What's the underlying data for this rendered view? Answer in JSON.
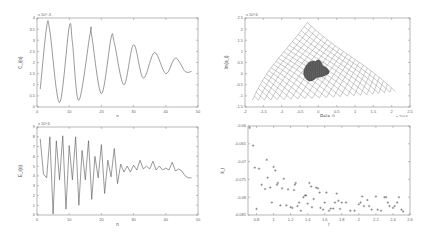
{
  "chart_data": [
    {
      "id": "top-left",
      "type": "line",
      "title": "",
      "xlabel": "n",
      "ylabel": "C_i(n)",
      "y_multiplier": "x 10^-3",
      "xlim": [
        0,
        50
      ],
      "ylim": [
        0,
        4
      ],
      "xticks": [
        0,
        10,
        20,
        30,
        40,
        50
      ],
      "yticks": [
        0,
        0.5,
        1,
        1.5,
        2,
        2.5,
        3,
        3.5,
        4
      ],
      "grid": false,
      "description": "Damped oscillation: peaks ~3.6, 3.6, 3.3, 3.1, 2.8, 2.5, 2.2; troughs ~0.2, 0.3, 0.6, 1.0, 1.3, 1.5, decaying toward ~1.6 at n=48",
      "series": [
        {
          "name": "C_i(n)",
          "x": [
            1,
            3,
            4,
            7,
            10,
            11,
            13,
            16.5,
            17,
            20,
            23,
            24,
            27,
            30,
            33,
            36.5,
            40,
            43,
            46,
            48
          ],
          "y": [
            0.8,
            3.6,
            3.4,
            0.2,
            3.6,
            2.9,
            0.3,
            3.3,
            3.2,
            0.6,
            3.1,
            2.9,
            1.0,
            2.8,
            1.3,
            2.45,
            1.5,
            2.2,
            1.6,
            1.6
          ]
        }
      ]
    },
    {
      "id": "bottom-left",
      "type": "line",
      "title": "",
      "xlabel": "n",
      "ylabel": "E_i(n)",
      "y_multiplier": "x 10^4",
      "xlim": [
        0,
        50
      ],
      "ylim": [
        0,
        9
      ],
      "xticks": [
        0,
        10,
        20,
        30,
        40,
        50
      ],
      "yticks": [
        0,
        1,
        2,
        3,
        4,
        5,
        6,
        7,
        8,
        9
      ],
      "grid": false,
      "description": "Irregular decaying oscillation converging toward ~4",
      "series": [
        {
          "name": "E_i(n)",
          "x": [
            1,
            2,
            3,
            4,
            5,
            6,
            7,
            8,
            9,
            10,
            11,
            12,
            13,
            14,
            15,
            16,
            17,
            18,
            19,
            20,
            21,
            22,
            23,
            24,
            25,
            26,
            27,
            28,
            29,
            30,
            31,
            32,
            33,
            34,
            35,
            36,
            37,
            38,
            39,
            40,
            41,
            42,
            43,
            44,
            45,
            46,
            47,
            48
          ],
          "y": [
            7.8,
            4.2,
            3.8,
            8.0,
            0.1,
            7.6,
            3.6,
            8.1,
            0.6,
            7.1,
            3.6,
            8.0,
            1.0,
            6.6,
            3.6,
            7.6,
            1.6,
            6.0,
            3.8,
            7.2,
            2.2,
            5.6,
            3.9,
            6.8,
            3.2,
            5.2,
            4.4,
            5.0,
            4.4,
            5.1,
            4.6,
            5.6,
            4.7,
            5.0,
            4.7,
            5.5,
            4.6,
            5.0,
            4.6,
            4.8,
            4.6,
            5.4,
            4.5,
            4.7,
            4.5,
            4.0,
            3.8,
            3.8
          ]
        }
      ]
    },
    {
      "id": "top-right",
      "type": "line",
      "title": "",
      "xlabel": "Re(a_i)",
      "ylabel": "Im(a_i)",
      "x_multiplier": "x 10^4",
      "y_multiplier": "x 10^4",
      "xlim": [
        -2,
        2.5
      ],
      "ylim": [
        -1.5,
        2.5
      ],
      "xticks": [
        -2,
        -1.5,
        -1,
        -0.5,
        0,
        0.5,
        1,
        1.5,
        2,
        2.5
      ],
      "yticks": [
        -1.5,
        -1,
        -0.5,
        0,
        0.5,
        1,
        1.5,
        2,
        2.5
      ],
      "grid": false,
      "description": "Wireframe mesh forming a curved triangular surface with vertices near (-0.3, 2.3), (-1.8, -1.2), (2.1, -0.8); dense dark cluster near center (-0.1, 0.1)",
      "outline": [
        [
          -0.3,
          2.3
        ],
        [
          -1.8,
          -1.2
        ],
        [
          2.1,
          -0.8
        ]
      ],
      "center_cluster": [
        -0.1,
        0.1
      ]
    },
    {
      "id": "bottom-right",
      "type": "scatter",
      "title": "",
      "xlabel": "r",
      "ylabel": "k_i",
      "xlim": [
        0.7,
        2.6
      ],
      "ylim": [
        -0.085,
        -0.06
      ],
      "xticks": [
        0.8,
        1,
        1.2,
        1.4,
        1.6,
        1.8,
        2,
        2.2,
        2.4,
        2.6
      ],
      "yticks": [
        -0.085,
        -0.08,
        -0.075,
        -0.07,
        -0.065,
        -0.06
      ],
      "grid": false,
      "marker": "+",
      "series": [
        {
          "name": "points",
          "x": [
            0.72,
            0.76,
            0.78,
            0.8,
            0.83,
            0.86,
            0.9,
            0.92,
            0.93,
            0.96,
            0.98,
            1.0,
            1.02,
            1.04,
            1.05,
            1.08,
            1.1,
            1.12,
            1.15,
            1.17,
            1.2,
            1.22,
            1.24,
            1.25,
            1.26,
            1.28,
            1.3,
            1.32,
            1.35,
            1.37,
            1.38,
            1.4,
            1.42,
            1.44,
            1.45,
            1.47,
            1.5,
            1.52,
            1.54,
            1.55,
            1.58,
            1.6,
            1.62,
            1.65,
            1.67,
            1.7,
            1.72,
            1.74,
            1.76,
            1.78,
            1.8,
            1.85,
            1.9,
            1.95,
            2.0,
            2.02,
            2.04,
            2.06,
            2.1,
            2.12,
            2.15,
            2.2,
            2.22,
            2.26,
            2.3,
            2.32,
            2.34,
            2.36,
            2.4,
            2.42,
            2.45,
            2.47,
            2.5,
            2.52
          ],
          "y": [
            -0.0605,
            -0.0655,
            -0.0717,
            -0.0833,
            -0.072,
            -0.0765,
            -0.0777,
            -0.0695,
            -0.0745,
            -0.0773,
            -0.0815,
            -0.0715,
            -0.0725,
            -0.0765,
            -0.076,
            -0.0823,
            -0.0775,
            -0.0748,
            -0.0823,
            -0.0778,
            -0.0828,
            -0.083,
            -0.078,
            -0.0765,
            -0.076,
            -0.0825,
            -0.0815,
            -0.0838,
            -0.08,
            -0.0795,
            -0.0795,
            -0.0818,
            -0.076,
            -0.077,
            -0.0828,
            -0.0805,
            -0.0773,
            -0.0775,
            -0.0787,
            -0.083,
            -0.0835,
            -0.0815,
            -0.0787,
            -0.0838,
            -0.0832,
            -0.0832,
            -0.0815,
            -0.079,
            -0.081,
            -0.0833,
            -0.0815,
            -0.0815,
            -0.0838,
            -0.0838,
            -0.082,
            -0.0815,
            -0.0798,
            -0.0825,
            -0.0808,
            -0.0825,
            -0.0835,
            -0.0798,
            -0.0835,
            -0.0838,
            -0.08,
            -0.08,
            -0.0815,
            -0.0825,
            -0.083,
            -0.0825,
            -0.0815,
            -0.08,
            -0.0835,
            -0.084
          ]
        }
      ]
    }
  ]
}
